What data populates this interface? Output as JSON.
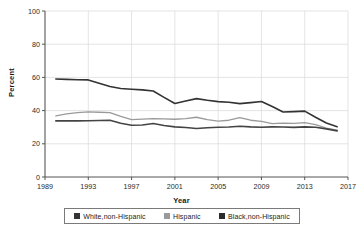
{
  "chart_data": {
    "type": "line",
    "title": "",
    "xlabel": "Year",
    "ylabel": "Percent",
    "xlim": [
      1989,
      2017
    ],
    "ylim": [
      0,
      100
    ],
    "grid": true,
    "legend_position": "bottom",
    "x_ticks": [
      "1989",
      "1993",
      "1997",
      "2001",
      "2005",
      "2009",
      "2013",
      "2017"
    ],
    "y_ticks": [
      "0",
      "20",
      "40",
      "60",
      "80",
      "100"
    ],
    "x": [
      1990,
      1991,
      1992,
      1993,
      1994,
      1995,
      1996,
      1997,
      1998,
      1999,
      2000,
      2001,
      2002,
      2003,
      2004,
      2005,
      2006,
      2007,
      2008,
      2009,
      2010,
      2011,
      2012,
      2013,
      2014,
      2015,
      2016
    ],
    "series": [
      {
        "name": "White,non-Hispanic",
        "color": "#333333",
        "values": [
          59.0,
          58.8,
          58.6,
          58.5,
          56.5,
          54.5,
          53.3,
          52.9,
          52.5,
          51.8,
          48.0,
          44.3,
          45.8,
          47.2,
          46.2,
          45.4,
          45.0,
          44.2,
          44.8,
          45.5,
          42.5,
          39.2,
          39.4,
          39.7,
          36.0,
          32.5,
          30.3
        ]
      },
      {
        "name": "Hispanic",
        "color": "#9a9a9a",
        "values": [
          36.8,
          38.0,
          38.8,
          39.2,
          39.0,
          38.8,
          36.5,
          34.6,
          34.9,
          35.2,
          35.0,
          34.8,
          35.2,
          36.0,
          34.6,
          33.6,
          34.2,
          35.8,
          34.2,
          33.5,
          32.2,
          32.5,
          32.3,
          32.7,
          31.5,
          29.5,
          28.3
        ]
      },
      {
        "name": "Black,non-Hispanic",
        "color": "#444444",
        "values": [
          33.8,
          33.8,
          33.8,
          33.9,
          34.0,
          34.2,
          32.4,
          31.2,
          31.3,
          32.2,
          31.0,
          30.2,
          29.8,
          29.2,
          29.7,
          30.0,
          30.1,
          30.6,
          30.2,
          30.0,
          30.2,
          30.1,
          29.9,
          30.2,
          30.0,
          29.0,
          27.8
        ]
      }
    ]
  },
  "legend": {
    "items": [
      {
        "label": "White,non-Hispanic",
        "color": "#333333"
      },
      {
        "label": "Hispanic",
        "color": "#9a9a9a"
      },
      {
        "label": "Black,non-Hispanic",
        "color": "#2b2b2b"
      }
    ]
  }
}
